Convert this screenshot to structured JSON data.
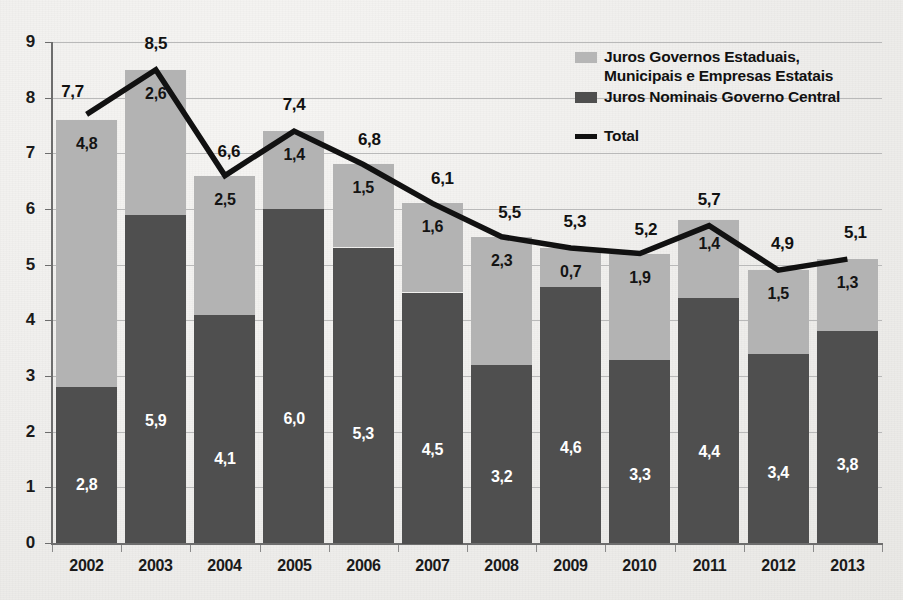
{
  "chart_data": {
    "type": "bar",
    "subtype": "stacked-bar-with-line",
    "title": "",
    "xlabel": "",
    "ylabel": "",
    "ylim": [
      0,
      9
    ],
    "ytick_step": 1,
    "ytick_labels": [
      "0",
      "1",
      "2",
      "3",
      "4",
      "5",
      "6",
      "7",
      "8",
      "9"
    ],
    "grid": true,
    "grid_orientation": "horizontal",
    "legend_position": "top-right",
    "decimal_separator": ",",
    "categories": [
      "2002",
      "2003",
      "2004",
      "2005",
      "2006",
      "2007",
      "2008",
      "2009",
      "2010",
      "2011",
      "2012",
      "2013"
    ],
    "series": [
      {
        "name": "Juros Nominais Governo Central",
        "type": "bar",
        "stack": "lower",
        "color": "#4f4f4f",
        "values": [
          2.8,
          5.9,
          4.1,
          6.0,
          5.3,
          4.5,
          3.2,
          4.6,
          3.3,
          4.4,
          3.4,
          3.8
        ],
        "labels": [
          "2,8",
          "5,9",
          "4,1",
          "6,0",
          "5,3",
          "4,5",
          "3,2",
          "4,6",
          "3,3",
          "4,4",
          "3,4",
          "3,8"
        ]
      },
      {
        "name": "Juros Governos Estaduais, Municipais e Empresas Estatais",
        "type": "bar",
        "stack": "upper",
        "color": "#b3b3b3",
        "values": [
          4.8,
          2.6,
          2.5,
          1.4,
          1.5,
          1.6,
          2.3,
          0.7,
          1.9,
          1.4,
          1.5,
          1.3
        ],
        "labels": [
          "4,8",
          "2,6",
          "2,5",
          "1,4",
          "1,5",
          "1,6",
          "2,3",
          "0,7",
          "1,9",
          "1,4",
          "1,5",
          "1,3"
        ]
      },
      {
        "name": "Total",
        "type": "line",
        "color": "#111111",
        "values": [
          7.7,
          8.5,
          6.6,
          7.4,
          6.8,
          6.1,
          5.5,
          5.3,
          5.2,
          5.7,
          4.9,
          5.1
        ],
        "labels": [
          "7,7",
          "8,5",
          "6,6",
          "7,4",
          "6,8",
          "6,1",
          "5,5",
          "5,3",
          "5,2",
          "5,7",
          "4,9",
          "5,1"
        ]
      }
    ]
  },
  "legend": {
    "items": [
      {
        "label": "Juros Governos Estaduais,\nMunicipais e Empresas Estatais",
        "marker": "swatch-light",
        "color": "#b6b6b6"
      },
      {
        "label": "Juros Nominais Governo Central",
        "marker": "swatch-dark",
        "color": "#4f4f4f"
      },
      {
        "label": "Total",
        "marker": "line-black",
        "color": "#111111"
      }
    ]
  }
}
